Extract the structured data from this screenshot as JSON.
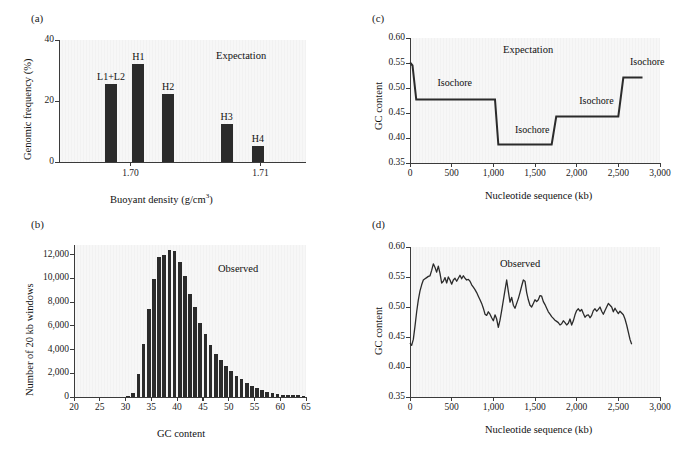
{
  "figure": {
    "panel_labels": {
      "a": "(a)",
      "b": "(b)",
      "c": "(c)",
      "d": "(d)"
    }
  },
  "chart_data": [
    {
      "panel": "a",
      "type": "bar",
      "title": "",
      "annotation": "Expectation",
      "xlabel": "Buoyant density (g/cm3)",
      "xlabel_base": "Buoyant density (g/cm",
      "xlabel_sup": "3",
      "xlabel_tail": ")",
      "ylabel": "Genomic frequency (%)",
      "ylim": [
        0,
        40
      ],
      "yticks": [
        0,
        20,
        40
      ],
      "ytick_labels": [
        "0",
        "20",
        "40"
      ],
      "xlim": [
        1.6945,
        1.7135
      ],
      "xticks": [
        1.7,
        1.71
      ],
      "xtick_labels": [
        "1.70",
        "1.71"
      ],
      "categories": [
        "L1+L2",
        "H1",
        "H2",
        "H3",
        "H4"
      ],
      "values": [
        25.5,
        32.0,
        22.2,
        12.5,
        5.2
      ],
      "x_positions": [
        1.6985,
        1.7006,
        1.7029,
        1.7074,
        1.7098
      ],
      "grid": false
    },
    {
      "panel": "b",
      "type": "bar",
      "title": "",
      "annotation": "Observed",
      "xlabel": "GC content",
      "ylabel": "Number of 20 kb windows",
      "ylim": [
        0,
        12800
      ],
      "yticks": [
        0,
        2000,
        4000,
        6000,
        8000,
        10000,
        12000
      ],
      "ytick_labels": [
        "0",
        "2,000",
        "4,000",
        "6,000",
        "8,000",
        "10,000",
        "12,000"
      ],
      "xlim": [
        20,
        65
      ],
      "xticks": [
        20,
        25,
        30,
        35,
        40,
        45,
        50,
        55,
        60,
        65
      ],
      "xtick_labels": [
        "20",
        "25",
        "30",
        "35",
        "40",
        "45",
        "50",
        "55",
        "60",
        "65"
      ],
      "categories": [
        30,
        31,
        32,
        33,
        34,
        35,
        36,
        37,
        38,
        39,
        40,
        41,
        42,
        43,
        44,
        45,
        46,
        47,
        48,
        49,
        50,
        51,
        52,
        53,
        54,
        55,
        56,
        57,
        58,
        59,
        60,
        61,
        62,
        63,
        64
      ],
      "values": [
        60,
        300,
        1950,
        4500,
        7400,
        9900,
        11750,
        11950,
        12350,
        12300,
        11400,
        10150,
        8700,
        7550,
        6250,
        5300,
        4400,
        3650,
        3100,
        2600,
        2150,
        1800,
        1500,
        1150,
        900,
        720,
        560,
        430,
        340,
        260,
        210,
        170,
        150,
        130,
        120
      ],
      "grid": false
    },
    {
      "panel": "c",
      "type": "line",
      "title": "",
      "annotation": "Expectation",
      "xlabel": "Nucleotide sequence (kb)",
      "ylabel": "GC content",
      "ylim": [
        0.35,
        0.6
      ],
      "yticks": [
        0.35,
        0.4,
        0.45,
        0.5,
        0.55,
        0.6
      ],
      "ytick_labels": [
        "0.35",
        "0.40",
        "0.45",
        "0.50",
        "0.55",
        "0.60"
      ],
      "xlim": [
        0,
        3000
      ],
      "xticks": [
        0,
        500,
        1000,
        1500,
        2000,
        2500,
        3000
      ],
      "xtick_labels": [
        "0",
        "500",
        "1,000",
        "1,500",
        "2,000",
        "2,500",
        "3,000"
      ],
      "series_name": "isochore step profile",
      "x": [
        0,
        30,
        75,
        1020,
        1060,
        1700,
        1755,
        2500,
        2560,
        2790
      ],
      "y": [
        0.551,
        0.545,
        0.477,
        0.477,
        0.387,
        0.387,
        0.443,
        0.443,
        0.521,
        0.521
      ],
      "isochore_labels": [
        {
          "text": "Isochore",
          "x": 330,
          "y": 0.498
        },
        {
          "text": "Isochore",
          "x": 1260,
          "y": 0.404
        },
        {
          "text": "Isochore",
          "x": 2030,
          "y": 0.462
        },
        {
          "text": "Isochore",
          "x": 2640,
          "y": 0.541
        }
      ],
      "grid": false
    },
    {
      "panel": "d",
      "type": "line",
      "title": "",
      "annotation": "Observed",
      "xlabel": "Nucleotide sequence (kb)",
      "ylabel": "GC content",
      "ylim": [
        0.35,
        0.6
      ],
      "yticks": [
        0.35,
        0.4,
        0.45,
        0.5,
        0.55,
        0.6
      ],
      "ytick_labels": [
        "0.35",
        "0.40",
        "0.45",
        "0.50",
        "0.55",
        "0.60"
      ],
      "xlim": [
        0,
        3000
      ],
      "xticks": [
        0,
        500,
        1000,
        1500,
        2000,
        2500,
        3000
      ],
      "xtick_labels": [
        "0",
        "500",
        "1,000",
        "1,500",
        "2,000",
        "2,500",
        "3,000"
      ],
      "series_name": "observed GC content",
      "x": [
        0,
        20,
        40,
        60,
        80,
        100,
        120,
        140,
        160,
        180,
        200,
        220,
        240,
        260,
        280,
        300,
        320,
        340,
        360,
        380,
        400,
        420,
        440,
        460,
        480,
        500,
        520,
        540,
        560,
        580,
        600,
        620,
        640,
        660,
        680,
        700,
        720,
        740,
        760,
        780,
        800,
        820,
        840,
        860,
        880,
        900,
        920,
        940,
        960,
        980,
        1000,
        1020,
        1040,
        1060,
        1080,
        1100,
        1120,
        1140,
        1160,
        1180,
        1200,
        1220,
        1240,
        1260,
        1280,
        1300,
        1320,
        1340,
        1360,
        1380,
        1400,
        1420,
        1440,
        1460,
        1480,
        1500,
        1520,
        1540,
        1560,
        1580,
        1600,
        1620,
        1640,
        1660,
        1680,
        1700,
        1720,
        1740,
        1760,
        1780,
        1800,
        1820,
        1840,
        1860,
        1880,
        1900,
        1920,
        1940,
        1960,
        1980,
        2000,
        2020,
        2040,
        2060,
        2080,
        2100,
        2120,
        2140,
        2160,
        2180,
        2200,
        2220,
        2240,
        2260,
        2280,
        2300,
        2320,
        2340,
        2360,
        2380,
        2400,
        2420,
        2440,
        2460,
        2480,
        2500,
        2520,
        2540,
        2560,
        2580,
        2600,
        2620,
        2640,
        2660,
        2680,
        2700,
        2720,
        2740,
        2760,
        2780
      ],
      "y": [
        0.44,
        0.436,
        0.446,
        0.468,
        0.492,
        0.512,
        0.527,
        0.537,
        0.545,
        0.547,
        0.549,
        0.551,
        0.552,
        0.561,
        0.572,
        0.566,
        0.558,
        0.568,
        0.556,
        0.54,
        0.543,
        0.549,
        0.54,
        0.55,
        0.545,
        0.538,
        0.545,
        0.548,
        0.543,
        0.548,
        0.553,
        0.547,
        0.552,
        0.548,
        0.545,
        0.546,
        0.543,
        0.537,
        0.533,
        0.529,
        0.524,
        0.518,
        0.512,
        0.506,
        0.498,
        0.488,
        0.486,
        0.492,
        0.488,
        0.482,
        0.477,
        0.487,
        0.48,
        0.466,
        0.478,
        0.494,
        0.511,
        0.528,
        0.545,
        0.526,
        0.508,
        0.516,
        0.503,
        0.498,
        0.506,
        0.514,
        0.524,
        0.535,
        0.545,
        0.543,
        0.524,
        0.512,
        0.503,
        0.5,
        0.506,
        0.512,
        0.509,
        0.512,
        0.519,
        0.518,
        0.509,
        0.504,
        0.498,
        0.492,
        0.488,
        0.484,
        0.481,
        0.478,
        0.476,
        0.474,
        0.47,
        0.472,
        0.477,
        0.474,
        0.47,
        0.473,
        0.48,
        0.47,
        0.477,
        0.487,
        0.494,
        0.497,
        0.493,
        0.496,
        0.489,
        0.483,
        0.486,
        0.487,
        0.482,
        0.486,
        0.494,
        0.497,
        0.493,
        0.496,
        0.5,
        0.493,
        0.488,
        0.494,
        0.5,
        0.506,
        0.503,
        0.5,
        0.492,
        0.498,
        0.493,
        0.489,
        0.493,
        0.49,
        0.487,
        0.48,
        0.47,
        0.458,
        0.446,
        0.438
      ],
      "grid": false
    }
  ]
}
